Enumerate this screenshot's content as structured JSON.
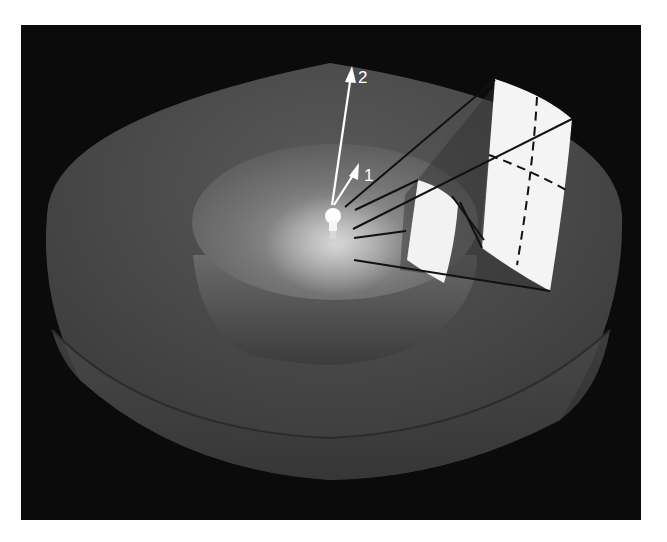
{
  "figure": {
    "background_color": "#0b0b0b",
    "outer_shell_color": "#4a4a4a",
    "inner_shell_color": "#6a6a6a",
    "patch_color": "#f4f4f4",
    "labels": {
      "radius_1": "1",
      "radius_2": "2"
    },
    "elements": {
      "light_source": "light-bulb-icon",
      "inner_patch": "single area patch at radius 1",
      "outer_patch": "area patch at radius 2 divided into 4 by dashed lines"
    }
  }
}
